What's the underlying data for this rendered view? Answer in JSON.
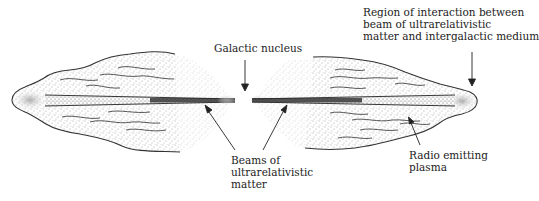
{
  "diagram": {
    "labels": {
      "galactic_nucleus": "Galactic nucleus",
      "region_of_interaction": [
        "Region of interaction between",
        "beam of ultrarelativistic",
        "matter and intergalactic medium"
      ],
      "beams": [
        "Beams of",
        "ultrarelativistic",
        "matter"
      ],
      "radio_plasma": [
        "Radio emitting",
        "plasma"
      ]
    },
    "colors": {
      "ink": "#222222",
      "stipple": "#555555",
      "beam": "#2a2a2a",
      "background": "#ffffff"
    }
  }
}
